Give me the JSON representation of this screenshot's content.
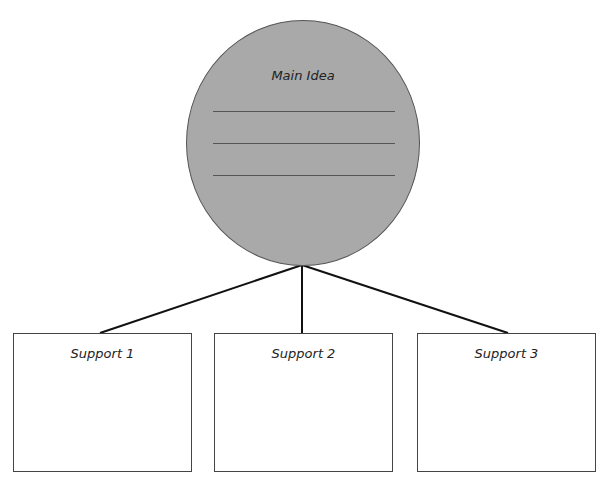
{
  "main_idea": {
    "title": "Main Idea",
    "write_lines": 3,
    "fill_color": "#a9a9a9"
  },
  "supports": [
    {
      "title": "Support 1"
    },
    {
      "title": "Support 2"
    },
    {
      "title": "Support 3"
    }
  ]
}
